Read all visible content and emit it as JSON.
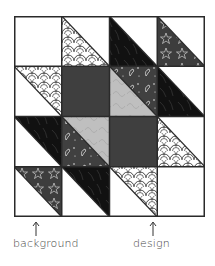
{
  "diagram": {
    "title": "",
    "grid": {
      "rows": 4,
      "cols": 4
    },
    "fabrics": {
      "background": {
        "name": "white",
        "color": "#ffffff"
      },
      "scallop": {
        "name": "scallop print",
        "base": "#ffffff",
        "line": "#333333"
      },
      "black": {
        "name": "black marbled",
        "base": "#111111",
        "streak": "#3a3a3a"
      },
      "stars": {
        "name": "star print",
        "base": "#3d3d3d",
        "line": "#cfcfcf"
      },
      "solid": {
        "name": "solid dark gray",
        "color": "#3f3f3f"
      },
      "paisley": {
        "name": "paisley print",
        "base": "#404040",
        "line": "#e8e8e8"
      },
      "swirl": {
        "name": "light gray swirl",
        "base": "#bdbdbd",
        "line": "#a5a5a5"
      }
    },
    "cells": [
      [
        {
          "type": "solid",
          "fabric": "background"
        },
        {
          "type": "hst",
          "ll": "scallop",
          "ur": "background"
        },
        {
          "type": "hst",
          "ll": "black",
          "ur": "background"
        },
        {
          "type": "hst",
          "ll": "stars",
          "ur": "background"
        }
      ],
      [
        {
          "type": "hst",
          "ll": "background",
          "ur": "scallop"
        },
        {
          "type": "solid",
          "fabric": "solid"
        },
        {
          "type": "hst",
          "ll": "swirl",
          "ur": "paisley"
        },
        {
          "type": "hst",
          "ll": "black",
          "ur": "background"
        }
      ],
      [
        {
          "type": "hst",
          "ll": "background",
          "ur": "black"
        },
        {
          "type": "hst",
          "ll": "paisley",
          "ur": "swirl"
        },
        {
          "type": "solid",
          "fabric": "solid"
        },
        {
          "type": "hst",
          "ll": "scallop",
          "ur": "background"
        }
      ],
      [
        {
          "type": "hst",
          "ll": "background",
          "ur": "stars"
        },
        {
          "type": "hst",
          "ll": "background",
          "ur": "black"
        },
        {
          "type": "hst",
          "ll": "background",
          "ur": "scallop"
        },
        {
          "type": "solid",
          "fabric": "background"
        }
      ]
    ],
    "labels": {
      "left": {
        "text": "background",
        "arrow_x": 36
      },
      "right": {
        "text": "design",
        "arrow_x": 153
      }
    },
    "border_color": "#2a2a2a"
  }
}
